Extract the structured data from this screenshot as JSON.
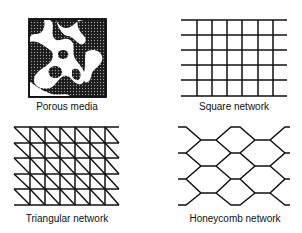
{
  "panels": [
    {
      "id": "porous",
      "label": "Porous media"
    },
    {
      "id": "square",
      "label": "Square network"
    },
    {
      "id": "triangular",
      "label": "Triangular network"
    },
    {
      "id": "honeycomb",
      "label": "Honeycomb network"
    }
  ],
  "colors": {
    "ink": "#111111",
    "background": "#ffffff"
  }
}
